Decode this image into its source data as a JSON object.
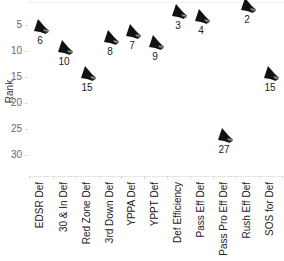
{
  "chart_data": {
    "type": "scatter",
    "title": "",
    "xlabel": "",
    "ylabel": "Rank",
    "ylim": [
      0,
      32
    ],
    "y_inverted": true,
    "yticks": [
      5,
      10,
      15,
      20,
      25,
      30
    ],
    "grid": false,
    "legend": null,
    "marker": "helmet-icon",
    "marker_color": "#111111",
    "categories": [
      "EDSR Def",
      "30 & In Def",
      "Red Zone Def",
      "3rd Down Def",
      "YPPA Def",
      "YPPT Def",
      "Def Efficiency",
      "Pass Eff Def",
      "Pass Pro Eff Def",
      "Rush Eff Def",
      "SOS for Def"
    ],
    "values": [
      6,
      10,
      15,
      8,
      7,
      9,
      3,
      4,
      27,
      2,
      15
    ],
    "data_labels": [
      "6",
      "10",
      "15",
      "8",
      "7",
      "9",
      "3",
      "4",
      "27",
      "2",
      "15"
    ]
  },
  "axis": {
    "ylabel": "Rank",
    "yticks": [
      "5",
      "10",
      "15",
      "20",
      "25",
      "30"
    ]
  }
}
